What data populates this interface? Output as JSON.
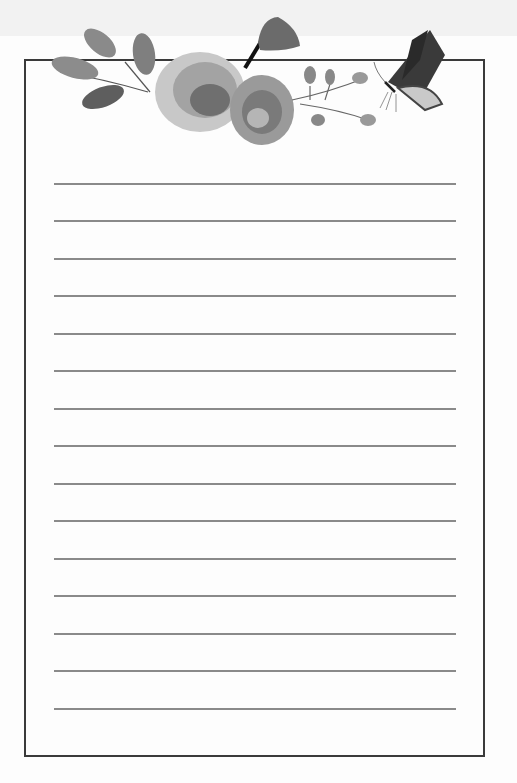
{
  "page": {
    "type": "lined stationery",
    "colors": {
      "frame": "#3a3a3a",
      "rule": "#8a8a8a",
      "paper": "#fdfdfd"
    },
    "ruled_lines": [
      183,
      220,
      258,
      295,
      333,
      370,
      408,
      445,
      483,
      520,
      558,
      595,
      633,
      670,
      708
    ]
  },
  "decoration": {
    "elements": [
      "leaf-sprigs",
      "roses",
      "bell-flower",
      "rosehip-berries",
      "butterfly"
    ]
  }
}
